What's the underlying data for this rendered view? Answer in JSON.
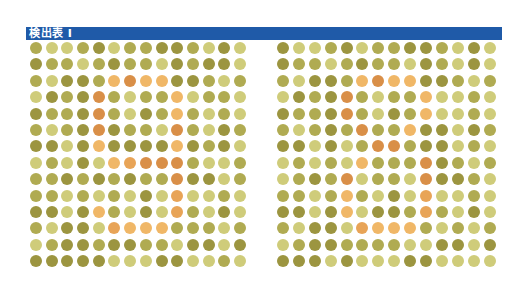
{
  "header": {
    "title": "検出表 I"
  },
  "palette": {
    "D": "#9c9540",
    "M": "#b0ab52",
    "L": "#cfcc7a",
    "o": "#f0b767",
    "O": "#e8a457",
    "R": "#d98f48"
  },
  "plates": [
    {
      "id": "left",
      "rows": [
        "MLLMDLMMDDMLDL",
        "DMMLMDMMLDMDDL",
        "MLDDMoRooDDMLM",
        "LDMDRMLMMoLMML",
        "DMMDRMLDMoMLML",
        "MLMDRDMMLRMLDM",
        "DDLDoDDDDoDMDL",
        "LMLDLoORRRMLLM",
        "MMDMDMDMMRDDLM",
        "MMLMLMLDLOLLML",
        "DDLDoMLDLOMLDL",
        "MLDDLOoooMMMLM",
        "LMDDMDDMMLDDLD",
        "DDDDDLLLDDLLML"
      ]
    },
    {
      "id": "right",
      "rows": [
        "DLLMDLMMDDMLDL",
        "DMMLMDMMLDMLDL",
        "MLDDMoRooDDMLM",
        "LDMDRMLMMoLLML",
        "DMMDRMLDMoLLML",
        "MLMDMRMMoDDLDM",
        "DDLDLMRRMDDLML",
        "LMLMLoMMMRDMLM",
        "LMDMRLMMLRDDML",
        "MMLMoMLDLOLLML",
        "DDLDoLDDMOMLDL",
        "MLDDLOoooMLMLM",
        "LMDDMMMMLLDDLD",
        "DDDLDLLLDDLLLL"
      ]
    }
  ]
}
